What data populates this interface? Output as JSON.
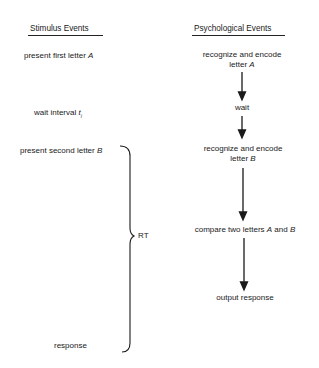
{
  "stimulus": {
    "header": "Stimulus Events",
    "events": [
      {
        "text": "present first letter ",
        "italic": "A"
      },
      {
        "text": "wait interval ",
        "italic": "t",
        "subscript": "i"
      },
      {
        "text": "present second letter ",
        "italic": "B"
      },
      {
        "text": "response"
      }
    ]
  },
  "psychological": {
    "header": "Psychological Events",
    "events": [
      {
        "line1": "recognize and encode",
        "line2": "letter ",
        "italic": "A"
      },
      {
        "line1": "wait"
      },
      {
        "line1": "recognize and encode",
        "line2": "letter ",
        "italic": "B"
      },
      {
        "line1": "compare two letters ",
        "italic": "A",
        "mid": " and ",
        "italic2": "B"
      },
      {
        "line1": "output response"
      }
    ]
  },
  "brace": {
    "label": "RT"
  },
  "colors": {
    "ink": "#1a1a1a",
    "background": "#ffffff"
  }
}
